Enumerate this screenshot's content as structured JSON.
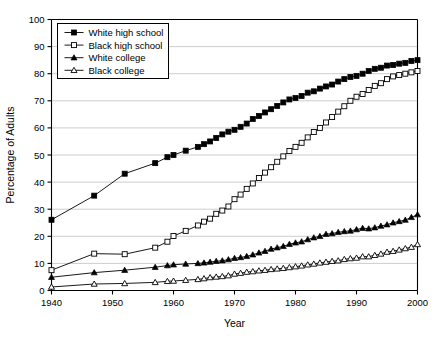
{
  "chart_data": {
    "type": "line",
    "title": "",
    "xlabel": "Year",
    "ylabel": "Percentage of Adults",
    "xlim": [
      1940,
      2000
    ],
    "ylim": [
      0,
      100
    ],
    "xticks": [
      1940,
      1950,
      1960,
      1970,
      1980,
      1990,
      2000
    ],
    "yticks": [
      0,
      10,
      20,
      30,
      40,
      50,
      60,
      70,
      80,
      90,
      100
    ],
    "grid": "horizontal",
    "legend_position": "upper-left-inside",
    "series": [
      {
        "name": "White high school",
        "marker": "filled-square",
        "color": "#000000",
        "x": [
          1940,
          1947,
          1952,
          1957,
          1959,
          1960,
          1962,
          1964,
          1965,
          1966,
          1967,
          1968,
          1969,
          1970,
          1971,
          1972,
          1973,
          1974,
          1975,
          1976,
          1977,
          1978,
          1979,
          1980,
          1981,
          1982,
          1983,
          1984,
          1985,
          1986,
          1987,
          1988,
          1989,
          1990,
          1991,
          1992,
          1993,
          1994,
          1995,
          1996,
          1997,
          1998,
          1999,
          2000
        ],
        "y": [
          26.1,
          35.0,
          43.1,
          47.0,
          49.2,
          50.0,
          51.6,
          53.0,
          54.0,
          55.0,
          56.3,
          57.6,
          58.6,
          59.3,
          60.4,
          61.6,
          63.3,
          64.4,
          65.7,
          66.9,
          68.1,
          69.4,
          70.5,
          71.0,
          71.8,
          73.0,
          73.5,
          74.5,
          75.3,
          76.0,
          77.1,
          78.0,
          78.8,
          79.2,
          80.0,
          81.0,
          81.8,
          82.2,
          83.0,
          83.2,
          83.7,
          84.0,
          84.7,
          85.0
        ]
      },
      {
        "name": "Black high school",
        "marker": "open-square",
        "color": "#000000",
        "x": [
          1940,
          1947,
          1952,
          1957,
          1959,
          1960,
          1962,
          1964,
          1965,
          1966,
          1967,
          1968,
          1969,
          1970,
          1971,
          1972,
          1973,
          1974,
          1975,
          1976,
          1977,
          1978,
          1979,
          1980,
          1981,
          1982,
          1983,
          1984,
          1985,
          1986,
          1987,
          1988,
          1989,
          1990,
          1991,
          1992,
          1993,
          1994,
          1995,
          1996,
          1997,
          1998,
          1999,
          2000
        ],
        "y": [
          7.5,
          13.6,
          13.4,
          15.8,
          18.0,
          20.1,
          22.0,
          24.0,
          25.4,
          26.5,
          28.3,
          29.5,
          31.0,
          33.7,
          35.4,
          37.5,
          39.5,
          41.5,
          43.5,
          45.5,
          47.5,
          49.5,
          51.5,
          53.0,
          54.5,
          56.5,
          58.5,
          60.0,
          62.0,
          64.0,
          66.0,
          68.0,
          70.0,
          71.5,
          72.5,
          74.0,
          75.5,
          76.5,
          78.0,
          79.0,
          79.5,
          80.0,
          80.5,
          81.0
        ]
      },
      {
        "name": "White college",
        "marker": "filled-triangle",
        "color": "#000000",
        "x": [
          1940,
          1947,
          1952,
          1957,
          1959,
          1960,
          1962,
          1964,
          1965,
          1966,
          1967,
          1968,
          1969,
          1970,
          1971,
          1972,
          1973,
          1974,
          1975,
          1976,
          1977,
          1978,
          1979,
          1980,
          1981,
          1982,
          1983,
          1984,
          1985,
          1986,
          1987,
          1988,
          1989,
          1990,
          1991,
          1992,
          1993,
          1994,
          1995,
          1996,
          1997,
          1998,
          1999,
          2000
        ],
        "y": [
          4.9,
          6.6,
          7.5,
          8.6,
          9.2,
          9.5,
          9.8,
          10.0,
          10.2,
          10.5,
          10.8,
          11.0,
          11.4,
          11.9,
          12.2,
          12.6,
          13.2,
          13.9,
          14.5,
          15.3,
          15.8,
          16.3,
          17.1,
          17.6,
          18.0,
          18.8,
          19.5,
          20.0,
          20.8,
          21.0,
          21.5,
          21.8,
          22.0,
          22.5,
          23.0,
          22.8,
          23.2,
          23.8,
          24.3,
          25.0,
          25.5,
          26.0,
          27.0,
          28.0
        ]
      },
      {
        "name": "Black college",
        "marker": "open-triangle",
        "color": "#000000",
        "x": [
          1940,
          1947,
          1952,
          1957,
          1959,
          1960,
          1962,
          1964,
          1965,
          1966,
          1967,
          1968,
          1969,
          1970,
          1971,
          1972,
          1973,
          1974,
          1975,
          1976,
          1977,
          1978,
          1979,
          1980,
          1981,
          1982,
          1983,
          1984,
          1985,
          1986,
          1987,
          1988,
          1989,
          1990,
          1991,
          1992,
          1993,
          1994,
          1995,
          1996,
          1997,
          1998,
          1999,
          2000
        ],
        "y": [
          1.3,
          2.4,
          2.6,
          3.0,
          3.4,
          3.5,
          3.8,
          4.1,
          4.4,
          4.8,
          5.0,
          5.2,
          5.5,
          6.1,
          6.4,
          6.8,
          7.0,
          7.3,
          7.5,
          7.8,
          8.0,
          8.2,
          8.5,
          8.8,
          9.1,
          9.5,
          9.8,
          10.2,
          10.5,
          10.8,
          11.0,
          11.5,
          11.8,
          12.0,
          12.5,
          12.5,
          13.0,
          13.5,
          14.2,
          14.5,
          15.0,
          15.5,
          16.0,
          17.0
        ]
      }
    ]
  }
}
